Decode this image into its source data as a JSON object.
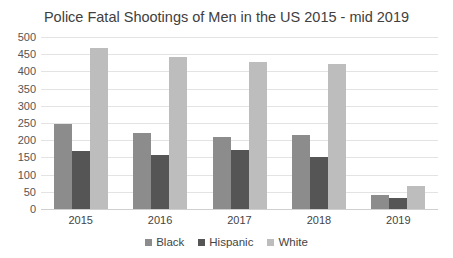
{
  "chart_data": {
    "type": "bar",
    "title": "Police Fatal Shootings of Men in the US 2015 - mid 2019",
    "categories": [
      "2015",
      "2016",
      "2017",
      "2018",
      "2019"
    ],
    "series": [
      {
        "name": "Black",
        "color": "#8c8c8c",
        "values": [
          247,
          221,
          209,
          214,
          41
        ]
      },
      {
        "name": "Hispanic",
        "color": "#555555",
        "values": [
          169,
          157,
          171,
          151,
          32
        ]
      },
      {
        "name": "White",
        "color": "#bdbdbd",
        "values": [
          468,
          442,
          427,
          421,
          67
        ]
      }
    ],
    "xlabel": "",
    "ylabel": "",
    "ylim": [
      0,
      500
    ],
    "yticks": [
      "0",
      "50",
      "100",
      "150",
      "200",
      "250",
      "300",
      "350",
      "400",
      "450",
      "500"
    ],
    "grid": true,
    "legend_position": "bottom"
  }
}
